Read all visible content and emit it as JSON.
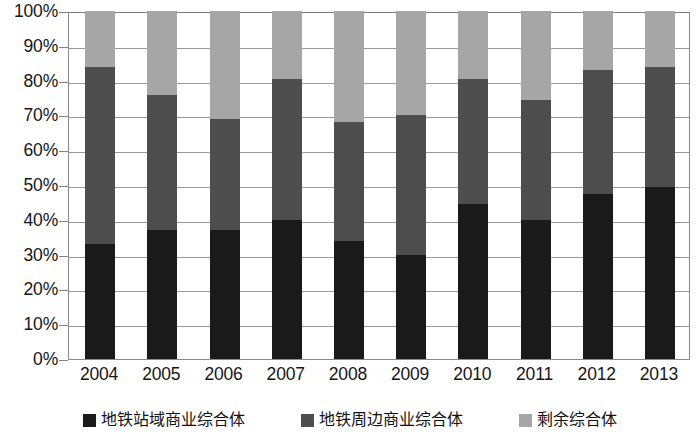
{
  "chart_data": {
    "type": "bar",
    "subtype": "stacked-100-percent",
    "title": "",
    "subtitle": "",
    "xlabel": "",
    "ylabel": "",
    "categories": [
      "2004",
      "2005",
      "2006",
      "2007",
      "2008",
      "2009",
      "2010",
      "2011",
      "2012",
      "2013"
    ],
    "series": [
      {
        "name": "地铁站域商业综合体",
        "color": "#1a1a1a",
        "values": [
          33,
          37,
          37,
          40,
          34,
          30,
          44.5,
          40,
          47.5,
          49.5
        ]
      },
      {
        "name": "地铁周边商业综合体",
        "color": "#4d4d4d",
        "values": [
          51,
          39,
          32,
          40.5,
          34,
          40,
          36,
          34.5,
          35.5,
          34.5
        ]
      },
      {
        "name": "剩余综合体",
        "color": "#a6a6a6",
        "values": [
          16,
          24,
          31,
          19.5,
          32,
          30,
          19.5,
          25.5,
          17,
          16
        ]
      }
    ],
    "cumulative_tops": {
      "series1_top": [
        33,
        37,
        37,
        40,
        34,
        30,
        44.5,
        40,
        47.5,
        49.5
      ],
      "series2_top": [
        84,
        76,
        69,
        80.5,
        68,
        70,
        80.5,
        74.5,
        83,
        84
      ],
      "series3_top": [
        100,
        100,
        100,
        100,
        100,
        100,
        100,
        100,
        100,
        100
      ]
    },
    "ylim": [
      0,
      100
    ],
    "ytick_values": [
      0,
      10,
      20,
      30,
      40,
      50,
      60,
      70,
      80,
      90,
      100
    ],
    "ytick_labels": [
      "0%",
      "10%",
      "20%",
      "30%",
      "40%",
      "50%",
      "60%",
      "70%",
      "80%",
      "90%",
      "100%"
    ],
    "grid": true,
    "grid_axis": "y",
    "legend_position": "bottom",
    "legend": [
      {
        "label": "地铁站域商业综合体",
        "color": "#1a1a1a"
      },
      {
        "label": "地铁周边商业综合体",
        "color": "#4d4d4d"
      },
      {
        "label": "剩余综合体",
        "color": "#a6a6a6"
      }
    ]
  },
  "colors": {
    "background": "#ffffff",
    "gridline": "#9a9a9a",
    "axis_line": "#8a8a8a",
    "tick_text": "#161616",
    "series_1": "#1a1a1a",
    "series_2": "#4d4d4d",
    "series_3": "#a6a6a6"
  }
}
